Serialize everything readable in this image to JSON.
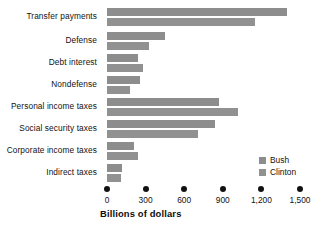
{
  "chart_data": {
    "type": "bar",
    "orientation": "horizontal",
    "title": "",
    "xlabel": "Billions of dollars",
    "ylabel": "",
    "xlim": [
      0,
      1500
    ],
    "xticks": [
      0,
      300,
      600,
      900,
      1200,
      1500
    ],
    "xtick_labels": [
      "0",
      "300",
      "600",
      "900",
      "1,200",
      "1,500"
    ],
    "grid": false,
    "legend_position": "lower-right",
    "categories": [
      "Transfer payments",
      "Defense",
      "Debt interest",
      "Nondefense",
      "Personal income taxes",
      "Social security taxes",
      "Corporate income taxes",
      "Indirect taxes"
    ],
    "series": [
      {
        "name": "Bush",
        "color": "#8d8d8d",
        "values": [
          1400,
          450,
          240,
          255,
          870,
          840,
          210,
          120
        ]
      },
      {
        "name": "Clinton",
        "color": "#919191",
        "values": [
          1150,
          330,
          280,
          180,
          1020,
          710,
          240,
          110
        ]
      }
    ]
  },
  "axis": {
    "title": "Billions of dollars"
  },
  "legend": {
    "items": [
      {
        "label": "Bush"
      },
      {
        "label": "Clinton"
      }
    ]
  }
}
